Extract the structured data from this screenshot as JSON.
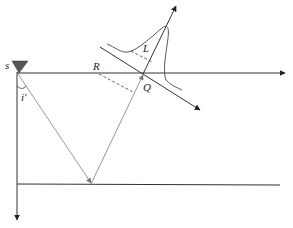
{
  "diagram": {
    "type": "seismic-ray-diagram",
    "labels": {
      "source": "s",
      "angle": "i'",
      "point_r": "R",
      "point_q": "Q",
      "wavelength": "L"
    },
    "colors": {
      "line": "#333333",
      "ray": "#8a8a8a",
      "source_fill": "#555555",
      "background": "#ffffff"
    }
  }
}
